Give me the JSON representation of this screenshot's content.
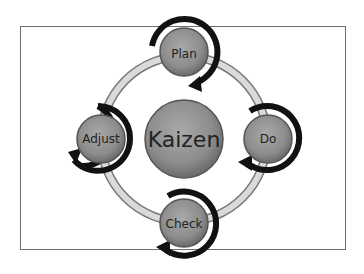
{
  "diagram": {
    "center": {
      "label": "Kaizen"
    },
    "steps": [
      {
        "label": "Plan"
      },
      {
        "label": "Do"
      },
      {
        "label": "Check"
      },
      {
        "label": "Adjust"
      }
    ]
  },
  "colors": {
    "node_fill": "#8e8e8e",
    "arrow": "#111111",
    "ring": "#d9d9d9",
    "frame": "#6e6e6e"
  }
}
